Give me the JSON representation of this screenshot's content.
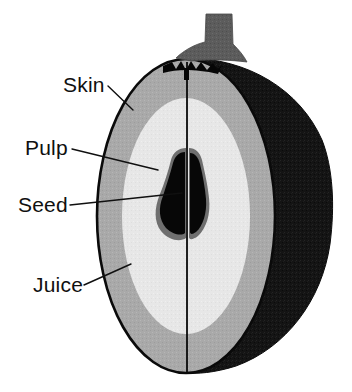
{
  "diagram": {
    "background_color": "#ffffff",
    "labels": [
      {
        "id": "skin",
        "text": "Skin",
        "text_x": 63,
        "text_y": 92,
        "leader_from_x": 108,
        "leader_from_y": 86,
        "leader_to_x": 133,
        "leader_to_y": 110
      },
      {
        "id": "pulp",
        "text": "Pulp",
        "text_x": 25,
        "text_y": 155,
        "leader_from_x": 72,
        "leader_from_y": 149,
        "leader_to_x": 158,
        "leader_to_y": 170
      },
      {
        "id": "seed",
        "text": "Seed",
        "text_x": 18,
        "text_y": 212,
        "leader_from_x": 70,
        "leader_from_y": 205,
        "leader_to_x": 182,
        "leader_to_y": 193
      },
      {
        "id": "juice",
        "text": "Juice",
        "text_x": 33,
        "text_y": 292,
        "leader_from_x": 84,
        "leader_from_y": 285,
        "leader_to_x": 131,
        "leader_to_y": 264
      }
    ],
    "parts": [
      {
        "id": "back-half",
        "name": "back half of fruit",
        "color": "#141414"
      },
      {
        "id": "skin-rind",
        "name": "skin outline",
        "color": "#0a0a0a"
      },
      {
        "id": "juice-layer",
        "name": "juice layer",
        "color": "#a9a9a9"
      },
      {
        "id": "pulp-layer",
        "name": "pulp layer",
        "color": "#e7e7e7"
      },
      {
        "id": "seed-left",
        "name": "left seed",
        "color": "#070707"
      },
      {
        "id": "seed-right",
        "name": "right seed",
        "color": "#070707"
      },
      {
        "id": "seed-halo",
        "name": "seed halo",
        "color": "#777777"
      },
      {
        "id": "stem",
        "name": "stem",
        "color": "#5c5c5c"
      },
      {
        "id": "calyx",
        "name": "calyx crown",
        "color": "#0a0a0a"
      },
      {
        "id": "center-line",
        "name": "center cut line",
        "color": "#0a0a0a"
      }
    ],
    "geometry": {
      "cut_face_center_x": 186,
      "cut_face_center_y": 216,
      "cut_face_rx": 89,
      "cut_face_ry": 157,
      "back_half_right_edge_x": 331,
      "stem_top_y": 14,
      "fruit_bottom_y": 373
    }
  }
}
